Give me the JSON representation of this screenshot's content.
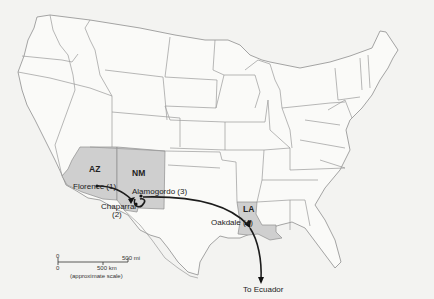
{
  "map": {
    "title": "Map of the United States showing detention transfer route",
    "colors": {
      "background": "#f3f3f1",
      "land": "#fafaf8",
      "highlighted_state": "#cfcfcf",
      "border": "#9a9a9a",
      "route": "#1c1c1c"
    },
    "highlighted_states": [
      {
        "abbr": "AZ"
      },
      {
        "abbr": "NM"
      },
      {
        "abbr": "LA"
      }
    ],
    "locations": [
      {
        "name": "Florence (1)"
      },
      {
        "name": "Chaparral",
        "order": "(2)"
      },
      {
        "name": "Alamogordo (3)"
      },
      {
        "name": "Oakdale (4)"
      }
    ],
    "destination": "To Ecuador",
    "scale_bar": {
      "zero_top": "0",
      "zero_bottom": "0",
      "mi_label": "500 mi",
      "km_label": "500 km",
      "note": "(approximate scale)"
    }
  }
}
